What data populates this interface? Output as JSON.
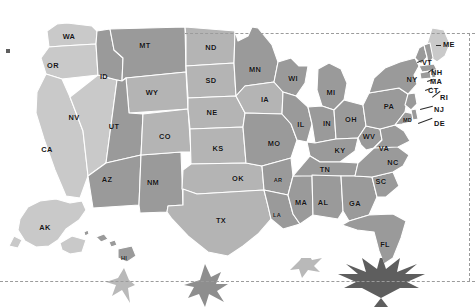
{
  "map": {
    "title": "United States map with state abbreviations",
    "background_color": "#ffffff",
    "border_color": "#ffffff",
    "dash_color": "#9b9b9b",
    "label_color": "#151515",
    "shades": {
      "light": "#c9c9c9",
      "medium": "#b4b4b4",
      "dark": "#9a9a9a",
      "darkest": "#8d8d8d"
    },
    "states": [
      {
        "id": "WA",
        "label": "WA",
        "x": 69,
        "y": 37,
        "shade": "light"
      },
      {
        "id": "OR",
        "label": "OR",
        "x": 53,
        "y": 66,
        "shade": "light"
      },
      {
        "id": "CA",
        "label": "CA",
        "x": 47,
        "y": 150,
        "shade": "light"
      },
      {
        "id": "NV",
        "label": "NV",
        "x": 74,
        "y": 118,
        "shade": "light"
      },
      {
        "id": "ID",
        "label": "ID",
        "x": 104,
        "y": 77,
        "shade": "dark"
      },
      {
        "id": "MT",
        "label": "MT",
        "x": 145,
        "y": 46,
        "shade": "dark"
      },
      {
        "id": "WY",
        "label": "WY",
        "x": 152,
        "y": 93,
        "shade": "medium"
      },
      {
        "id": "UT",
        "label": "UT",
        "x": 114,
        "y": 127,
        "shade": "dark"
      },
      {
        "id": "AZ",
        "label": "AZ",
        "x": 107,
        "y": 180,
        "shade": "dark"
      },
      {
        "id": "NM",
        "label": "NM",
        "x": 153,
        "y": 183,
        "shade": "dark"
      },
      {
        "id": "CO",
        "label": "CO",
        "x": 165,
        "y": 137,
        "shade": "medium"
      },
      {
        "id": "ND",
        "label": "ND",
        "x": 211,
        "y": 48,
        "shade": "medium"
      },
      {
        "id": "SD",
        "label": "SD",
        "x": 211,
        "y": 81,
        "shade": "medium"
      },
      {
        "id": "NE",
        "label": "NE",
        "x": 212,
        "y": 113,
        "shade": "medium"
      },
      {
        "id": "KS",
        "label": "KS",
        "x": 218,
        "y": 149,
        "shade": "medium"
      },
      {
        "id": "OK",
        "label": "OK",
        "x": 238,
        "y": 179,
        "shade": "medium"
      },
      {
        "id": "TX",
        "label": "TX",
        "x": 221,
        "y": 221,
        "shade": "medium"
      },
      {
        "id": "MN",
        "label": "MN",
        "x": 255,
        "y": 70,
        "shade": "dark"
      },
      {
        "id": "IA",
        "label": "IA",
        "x": 265,
        "y": 100,
        "shade": "medium"
      },
      {
        "id": "MO",
        "label": "MO",
        "x": 274,
        "y": 144,
        "shade": "dark"
      },
      {
        "id": "AR",
        "label": "AR",
        "x": 278,
        "y": 181,
        "shade": "dark",
        "small": true
      },
      {
        "id": "LA",
        "label": "LA",
        "x": 277,
        "y": 216,
        "shade": "dark",
        "small": true
      },
      {
        "id": "WI",
        "label": "WI",
        "x": 293,
        "y": 79,
        "shade": "dark"
      },
      {
        "id": "IL",
        "label": "IL",
        "x": 301,
        "y": 125,
        "shade": "dark"
      },
      {
        "id": "MS",
        "label": "MA",
        "x": 301,
        "y": 203,
        "shade": "dark"
      },
      {
        "id": "MI",
        "label": "MI",
        "x": 331,
        "y": 93,
        "shade": "dark"
      },
      {
        "id": "IN",
        "label": "IN",
        "x": 327,
        "y": 124,
        "shade": "dark"
      },
      {
        "id": "KY",
        "label": "KY",
        "x": 340,
        "y": 151,
        "shade": "dark"
      },
      {
        "id": "TN",
        "label": "TN",
        "x": 325,
        "y": 170,
        "shade": "dark"
      },
      {
        "id": "AL",
        "label": "AL",
        "x": 323,
        "y": 203,
        "shade": "dark"
      },
      {
        "id": "OH",
        "label": "OH",
        "x": 351,
        "y": 120,
        "shade": "dark"
      },
      {
        "id": "WV",
        "label": "WV",
        "x": 369,
        "y": 137,
        "shade": "dark"
      },
      {
        "id": "VA",
        "label": "VA",
        "x": 384,
        "y": 149,
        "shade": "dark"
      },
      {
        "id": "NC",
        "label": "NC",
        "x": 393,
        "y": 163,
        "shade": "dark"
      },
      {
        "id": "SC",
        "label": "SC",
        "x": 381,
        "y": 182,
        "shade": "dark"
      },
      {
        "id": "GA",
        "label": "GA",
        "x": 355,
        "y": 204,
        "shade": "dark"
      },
      {
        "id": "FL",
        "label": "FL",
        "x": 385,
        "y": 245,
        "shade": "dark"
      },
      {
        "id": "PA",
        "label": "PA",
        "x": 389,
        "y": 107,
        "shade": "dark"
      },
      {
        "id": "NY",
        "label": "NY",
        "x": 412,
        "y": 80,
        "shade": "dark"
      },
      {
        "id": "AK",
        "label": "AK",
        "x": 45,
        "y": 228,
        "shade": "light"
      },
      {
        "id": "HI",
        "label": "HI",
        "x": 124,
        "y": 259,
        "shade": "dark",
        "small": true
      }
    ],
    "leader_labels": [
      {
        "id": "ME",
        "label": "ME",
        "x": 443,
        "y": 45,
        "shade": "light"
      },
      {
        "id": "VT",
        "label": "VT",
        "x": 422,
        "y": 63,
        "shade": "dark"
      },
      {
        "id": "NH",
        "label": "NH",
        "x": 431,
        "y": 73,
        "shade": "dark"
      },
      {
        "id": "MA",
        "label": "MA",
        "x": 430,
        "y": 82,
        "shade": "dark"
      },
      {
        "id": "CT",
        "label": "CT",
        "x": 428,
        "y": 91,
        "shade": "dark"
      },
      {
        "id": "RI",
        "label": "RI",
        "x": 440,
        "y": 98,
        "shade": "dark"
      },
      {
        "id": "NJ",
        "label": "NJ",
        "x": 434,
        "y": 110,
        "shade": "dark"
      },
      {
        "id": "MD",
        "label": "MD",
        "x": 403,
        "y": 121,
        "shade": "dark",
        "small": true
      },
      {
        "id": "DE",
        "label": "DE",
        "x": 434,
        "y": 124,
        "shade": "dark"
      }
    ],
    "insets": [
      {
        "id": "alaska",
        "label": "AK"
      },
      {
        "id": "hawaii",
        "label": "HI"
      }
    ],
    "decoration": {
      "name": "cannabis-leaves",
      "count": 4,
      "color_dark": "#6d6d6d",
      "color_light": "#b9b9b9"
    }
  }
}
